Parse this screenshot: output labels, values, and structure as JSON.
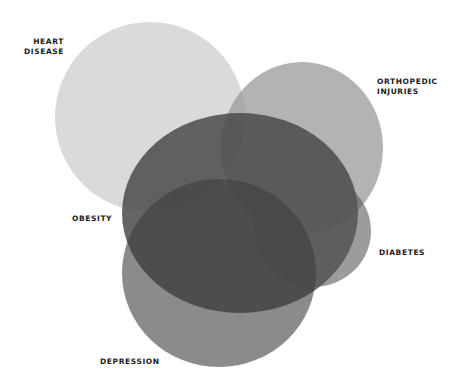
{
  "diagram": {
    "type": "venn",
    "sets": [
      {
        "id": "heart-disease",
        "label": "HEART\nDISEASE",
        "cx": 150,
        "cy": 117,
        "rx": 95,
        "ry": 95,
        "fill": "#d6d6d6",
        "opacity": 0.9
      },
      {
        "id": "orthopedic-injuries",
        "label": "ORTHOPEDIC\nINJURIES",
        "cx": 302,
        "cy": 148,
        "rx": 81,
        "ry": 86,
        "fill": "#9a9a9a",
        "opacity": 0.75
      },
      {
        "id": "obesity",
        "label": "OBESITY",
        "cx": 240,
        "cy": 213,
        "rx": 118,
        "ry": 100,
        "fill": "#4a4a4a",
        "opacity": 0.85
      },
      {
        "id": "diabetes",
        "label": "DIABETES",
        "cx": 313,
        "cy": 231,
        "rx": 58,
        "ry": 56,
        "fill": "#5a5a5a",
        "opacity": 0.6
      },
      {
        "id": "depression",
        "label": "DEPRESSION",
        "cx": 219,
        "cy": 273,
        "rx": 97,
        "ry": 94,
        "fill": "#3e3e3e",
        "opacity": 0.6
      }
    ]
  },
  "labels": {
    "heart_disease": "HEART\nDISEASE",
    "orthopedic_injuries": "ORTHOPEDIC\nINJURIES",
    "obesity": "OBESITY",
    "diabetes": "DIABETES",
    "depression": "DEPRESSION"
  }
}
